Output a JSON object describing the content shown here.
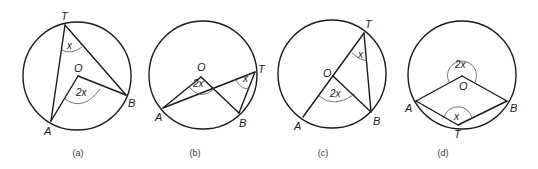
{
  "figure": {
    "diagrams": [
      {
        "id": "a",
        "caption": "(a)",
        "points": {
          "T": "T",
          "O": "O",
          "A": "A",
          "B": "B"
        },
        "angles": {
          "inscribed": "x",
          "central": "2x"
        }
      },
      {
        "id": "b",
        "caption": "(b)",
        "points": {
          "T": "T",
          "O": "O",
          "A": "A",
          "B": "B"
        },
        "angles": {
          "inscribed": "x",
          "central": "2x"
        }
      },
      {
        "id": "c",
        "caption": "(c)",
        "points": {
          "T": "T",
          "O": "O",
          "A": "A",
          "B": "B"
        },
        "angles": {
          "inscribed": "x",
          "central": "2x"
        }
      },
      {
        "id": "d",
        "caption": "(d)",
        "points": {
          "T": "T",
          "O": "O",
          "A": "A",
          "B": "B"
        },
        "angles": {
          "inscribed": "x",
          "central": "2x"
        }
      }
    ]
  }
}
